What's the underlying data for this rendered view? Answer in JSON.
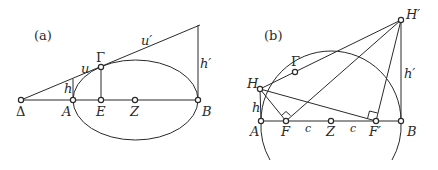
{
  "panels": [
    {
      "id": "a",
      "caption": "(a)",
      "points": {
        "Delta": {
          "label": "Δ"
        },
        "A": {
          "label": "A"
        },
        "E": {
          "label": "E"
        },
        "Z": {
          "label": "Z"
        },
        "B": {
          "label": "B"
        },
        "Gamma": {
          "label": "Γ"
        }
      },
      "segment_labels": {
        "h": "h",
        "u": "u",
        "u_prime": "u′",
        "h_prime": "h′"
      }
    },
    {
      "id": "b",
      "caption": "(b)",
      "points": {
        "H": {
          "label": "H"
        },
        "Gamma": {
          "label": "Γ"
        },
        "H_prime": {
          "label": "H′"
        },
        "A": {
          "label": "A"
        },
        "F": {
          "label": "F"
        },
        "Z": {
          "label": "Z"
        },
        "F_prime": {
          "label": "F′"
        },
        "B": {
          "label": "B"
        }
      },
      "segment_labels": {
        "h": "h",
        "h_prime": "h′",
        "c1": "c",
        "c2": "c"
      }
    }
  ]
}
